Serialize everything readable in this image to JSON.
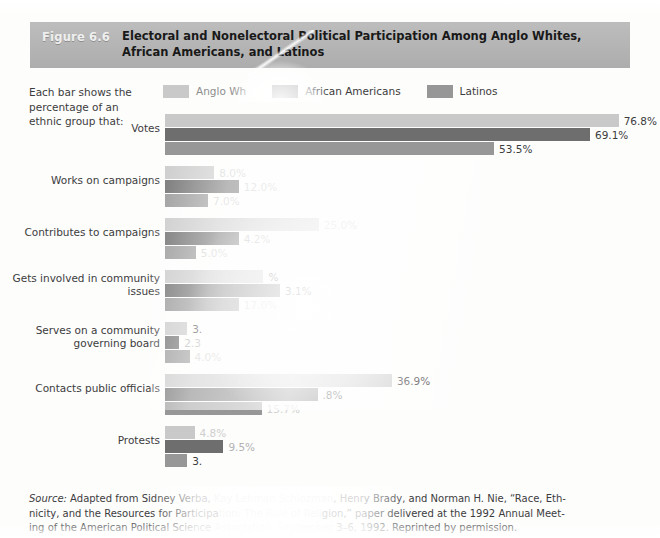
{
  "figure": {
    "number": "Figure 6.6",
    "title": "Electoral and Nonelectoral Political Participation Among Anglo Whites, African Americans, and Latinos"
  },
  "intro_text": "Each bar shows the percentage of an ethnic group that:",
  "colors": {
    "anglo_whites": "#c9c9c9",
    "african_americans": "#6e6e6e",
    "latinos": "#979797",
    "header_band": "#b5b5b5",
    "page_background": "#fdfdfc",
    "text": "#3c3c3c"
  },
  "legend": {
    "items": [
      {
        "label": "Anglo Wh",
        "color_key": "anglo_whites",
        "faded": true
      },
      {
        "label": "African Americans",
        "color_key": "african_americans",
        "faded": false
      },
      {
        "label": "Latinos",
        "color_key": "latinos",
        "faded": false
      }
    ]
  },
  "source_note": {
    "line1_a": "Source:",
    "line1_b": " Adapted from Sidney Verba, ",
    "line1_ghost": "Kay Lehman Schlozman",
    "line1_c": ", Henry Brady, and Norman H. Nie, “Race, Eth-",
    "line2_a": "nicity, and the Resources for Participa",
    "line2_ghost": "tion: The Role of Reli",
    "line2_c": "gion,” paper delivered at the 1992 Annual Meet-",
    "line3_a": "ing of the American Political Science ",
    "line3_ghost": "Association, September",
    "line3_c": " 3–6, 1992. Reprinted by permission."
  },
  "chart_data": {
    "type": "bar",
    "orientation": "horizontal",
    "title": "Electoral and Nonelectoral Political Participation Among Anglo Whites, African Americans, and Latinos",
    "xlabel": "",
    "ylabel": "",
    "xlim": [
      0,
      80
    ],
    "grid": false,
    "legend_position": "top",
    "value_suffix": "%",
    "categories": [
      "Votes",
      "Works on campaigns",
      "Contributes to campaigns",
      "Gets involved in community issues",
      "Serves on a community governing board",
      "Contacts public officials",
      "Protests"
    ],
    "series": [
      {
        "name": "Anglo Whites",
        "color": "#c9c9c9",
        "values": [
          76.8,
          8.0,
          25.0,
          16.0,
          3.6,
          36.9,
          4.8
        ]
      },
      {
        "name": "African Americans",
        "color": "#6e6e6e",
        "values": [
          69.1,
          12.0,
          12.0,
          18.7,
          2.3,
          24.8,
          9.5
        ]
      },
      {
        "name": "Latinos",
        "color": "#979797",
        "values": [
          53.5,
          7.0,
          5.0,
          12.0,
          4.0,
          15.7,
          3.6
        ]
      }
    ],
    "rows": [
      {
        "label": "Votes",
        "bars": [
          {
            "series": "Anglo Whites",
            "value": 76.8,
            "value_label": "76.8%",
            "visibility": "clear"
          },
          {
            "series": "African Americans",
            "value": 69.1,
            "value_label": "69.1%",
            "visibility": "clear"
          },
          {
            "series": "Latinos",
            "value": 53.5,
            "value_label": "53.5%",
            "visibility": "clear"
          }
        ]
      },
      {
        "label": "Works on campaigns",
        "bars": [
          {
            "series": "Anglo Whites",
            "value": 8.0,
            "value_label": "8.0%",
            "visibility": "ghost"
          },
          {
            "series": "African Americans",
            "value": 12.0,
            "value_label": "12.0%",
            "visibility": "ghost"
          },
          {
            "series": "Latinos",
            "value": 7.0,
            "value_label": "7.0%",
            "visibility": "ghost"
          }
        ]
      },
      {
        "label": "Contributes to campaigns",
        "bars": [
          {
            "series": "Anglo Whites",
            "value": 25.0,
            "value_label": "25.0%",
            "visibility": "ghost"
          },
          {
            "series": "African Americans",
            "value": 12.0,
            "value_label": "4.2%",
            "visibility": "semi"
          },
          {
            "series": "Latinos",
            "value": 5.0,
            "value_label": "5.0%",
            "visibility": "ghost"
          }
        ]
      },
      {
        "label": "Gets involved in community issues",
        "bars": [
          {
            "series": "Anglo Whites",
            "value": 16.0,
            "value_label": "%",
            "visibility": "clear"
          },
          {
            "series": "African Americans",
            "value": 18.7,
            "value_label": "3.1%",
            "visibility": "clear"
          },
          {
            "series": "Latinos",
            "value": 12.0,
            "value_label": "17.0%",
            "visibility": "ghost"
          }
        ]
      },
      {
        "label": "Serves on a community governing board",
        "bars": [
          {
            "series": "Anglo Whites",
            "value": 3.6,
            "value_label": "3.",
            "visibility": "clear"
          },
          {
            "series": "African Americans",
            "value": 2.3,
            "value_label": "2.3",
            "visibility": "semi"
          },
          {
            "series": "Latinos",
            "value": 4.0,
            "value_label": "4.0%",
            "visibility": "ghost"
          }
        ]
      },
      {
        "label": "Contacts public officials",
        "bars": [
          {
            "series": "Anglo Whites",
            "value": 36.9,
            "value_label": "36.9%",
            "visibility": "clear"
          },
          {
            "series": "African Americans",
            "value": 24.8,
            "value_label": ".8%",
            "visibility": "clear"
          },
          {
            "series": "Latinos",
            "value": 15.7,
            "value_label": "15.7%",
            "visibility": "ghost"
          }
        ]
      },
      {
        "label": "Protests",
        "bars": [
          {
            "series": "Anglo Whites",
            "value": 4.8,
            "value_label": "4.8%",
            "visibility": "ghost"
          },
          {
            "series": "African Americans",
            "value": 9.5,
            "value_label": "9.5%",
            "visibility": "semi"
          },
          {
            "series": "Latinos",
            "value": 3.6,
            "value_label": "3.",
            "visibility": "clear"
          }
        ]
      }
    ]
  }
}
